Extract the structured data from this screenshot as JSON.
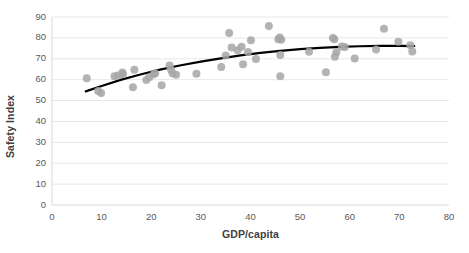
{
  "chart_data": {
    "type": "scatter",
    "title": "",
    "xlabel": "GDP/capita",
    "ylabel": "Safety Index",
    "xlim": [
      0,
      80
    ],
    "ylim": [
      0,
      90
    ],
    "xticks": [
      "0",
      "10",
      "20",
      "30",
      "40",
      "50",
      "60",
      "70",
      "80"
    ],
    "yticks": [
      "0",
      "10",
      "20",
      "30",
      "40",
      "50",
      "60",
      "70",
      "80",
      "90"
    ],
    "grid": "horizontal",
    "legend": "none",
    "series": [
      {
        "name": "Countries",
        "type": "scatter",
        "marker_color": "#a6a6a6",
        "marker_size": 5.2,
        "points": [
          [
            7.0,
            60.7
          ],
          [
            9.3,
            54.6
          ],
          [
            9.9,
            53.6
          ],
          [
            12.6,
            61.6
          ],
          [
            13.3,
            62.0
          ],
          [
            14.2,
            63.4
          ],
          [
            14.3,
            62.6
          ],
          [
            16.3,
            56.4
          ],
          [
            16.6,
            64.8
          ],
          [
            19.0,
            59.8
          ],
          [
            19.6,
            61.2
          ],
          [
            20.5,
            62.6
          ],
          [
            20.8,
            63.1
          ],
          [
            22.1,
            57.3
          ],
          [
            23.7,
            66.8
          ],
          [
            24.0,
            64.6
          ],
          [
            24.3,
            63.0
          ],
          [
            25.0,
            62.3
          ],
          [
            29.1,
            62.8
          ],
          [
            34.1,
            66.1
          ],
          [
            35.0,
            71.6
          ],
          [
            35.7,
            82.3
          ],
          [
            36.2,
            75.4
          ],
          [
            37.4,
            74.1
          ],
          [
            38.2,
            75.8
          ],
          [
            38.5,
            67.4
          ],
          [
            39.5,
            73.2
          ],
          [
            40.1,
            78.9
          ],
          [
            41.1,
            69.9
          ],
          [
            43.7,
            85.7
          ],
          [
            45.6,
            79.3
          ],
          [
            45.9,
            80.2
          ],
          [
            46.2,
            79.1
          ],
          [
            46.0,
            71.8
          ],
          [
            46.0,
            61.6
          ],
          [
            51.8,
            73.4
          ],
          [
            55.2,
            63.6
          ],
          [
            56.6,
            80.0
          ],
          [
            56.9,
            79.3
          ],
          [
            57.0,
            71.0
          ],
          [
            57.3,
            73.1
          ],
          [
            58.4,
            75.9
          ],
          [
            59.0,
            75.6
          ],
          [
            61.0,
            70.1
          ],
          [
            65.3,
            74.4
          ],
          [
            66.9,
            84.4
          ],
          [
            69.8,
            78.2
          ],
          [
            72.2,
            76.5
          ],
          [
            72.6,
            73.5
          ]
        ]
      },
      {
        "name": "Trendline",
        "type": "line",
        "line_color": "#000000",
        "line_width": 2.2,
        "points": [
          [
            6.8,
            54.4
          ],
          [
            10.0,
            57.0
          ],
          [
            14.0,
            60.0
          ],
          [
            18.0,
            62.6
          ],
          [
            22.0,
            64.9
          ],
          [
            26.0,
            66.9
          ],
          [
            30.0,
            68.6
          ],
          [
            34.0,
            70.2
          ],
          [
            38.0,
            71.6
          ],
          [
            42.0,
            72.8
          ],
          [
            46.0,
            73.8
          ],
          [
            50.0,
            74.6
          ],
          [
            54.0,
            75.2
          ],
          [
            58.0,
            75.7
          ],
          [
            62.0,
            76.0
          ],
          [
            66.0,
            76.2
          ],
          [
            70.0,
            76.2
          ],
          [
            73.0,
            76.1
          ]
        ]
      }
    ]
  },
  "axes": {
    "y_label": "Safety Index",
    "x_label": "GDP/capita"
  },
  "colors": {
    "marker": "#a6a6a6",
    "trendline": "#000000",
    "grid": "#e8e8e8",
    "axis": "#d9d9d9",
    "tick_text": "#595959",
    "label_text": "#404040",
    "background": "#ffffff"
  }
}
